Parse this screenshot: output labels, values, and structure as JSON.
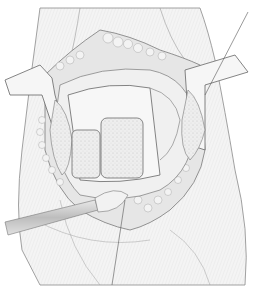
{
  "figure": {
    "style": "grayscale pencil line drawing",
    "colors": {
      "background": "#ffffff",
      "skin": "#f2f2f2",
      "line": "#6e6e6e",
      "fat": "#e4e4e4",
      "bone": "#ececec",
      "instrument": "#cfcfcf"
    },
    "elements": [
      {
        "name": "thigh-outline",
        "label": ""
      },
      {
        "name": "incision-fat-layer",
        "label": ""
      },
      {
        "name": "left-retractor",
        "label": ""
      },
      {
        "name": "right-retractor",
        "label": ""
      },
      {
        "name": "exposed-bone-block",
        "label": ""
      },
      {
        "name": "bone-graft-left",
        "label": ""
      },
      {
        "name": "bone-graft-right",
        "label": ""
      },
      {
        "name": "elevator-instrument",
        "label": ""
      },
      {
        "name": "leader-line-top",
        "label": ""
      },
      {
        "name": "leader-line-bottom",
        "label": ""
      }
    ]
  }
}
